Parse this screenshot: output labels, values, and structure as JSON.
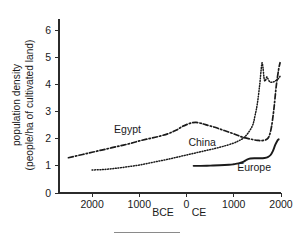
{
  "figure": {
    "name": "population-density-cultivated-land-chart",
    "background": "#ffffff",
    "ink_color": "#1a1a1a"
  },
  "chart_data": {
    "type": "line",
    "title": "",
    "xlabel": "",
    "ylabel": "population density (people/ha of cultivated land)",
    "ylabel_line1": "population density",
    "ylabel_line2": "(people/ha of cultivated land)",
    "xlim": [
      -2700,
      2000
    ],
    "ylim": [
      0,
      6.3
    ],
    "grid": false,
    "legend": "inline-labels",
    "x_axis_note_bce": "BCE",
    "x_axis_note_ce": "CE",
    "y_ticks": [
      0,
      1,
      2,
      3,
      4,
      5,
      6
    ],
    "y_tick_labels": [
      "0",
      "1",
      "2",
      "3",
      "4",
      "5",
      "6"
    ],
    "x_ticks": [
      -2000,
      -1000,
      0,
      1000,
      2000
    ],
    "x_tick_labels": [
      "2000",
      "1000",
      "0",
      "1000",
      "2000"
    ],
    "series": [
      {
        "name": "Egypt",
        "label": "Egypt",
        "style": "dash-dot",
        "color": "#1a1a1a",
        "points": [
          [
            -2500,
            1.3
          ],
          [
            -2200,
            1.42
          ],
          [
            -2000,
            1.5
          ],
          [
            -1800,
            1.58
          ],
          [
            -1600,
            1.66
          ],
          [
            -1400,
            1.74
          ],
          [
            -1200,
            1.82
          ],
          [
            -1000,
            1.92
          ],
          [
            -800,
            2.0
          ],
          [
            -600,
            2.08
          ],
          [
            -400,
            2.18
          ],
          [
            -300,
            2.25
          ],
          [
            -200,
            2.33
          ],
          [
            -100,
            2.44
          ],
          [
            0,
            2.52
          ],
          [
            100,
            2.58
          ],
          [
            200,
            2.6
          ],
          [
            300,
            2.57
          ],
          [
            400,
            2.52
          ],
          [
            600,
            2.42
          ],
          [
            800,
            2.3
          ],
          [
            1000,
            2.18
          ],
          [
            1200,
            2.05
          ],
          [
            1400,
            1.97
          ],
          [
            1500,
            1.94
          ],
          [
            1600,
            1.93
          ],
          [
            1700,
            1.98
          ],
          [
            1750,
            2.1
          ],
          [
            1800,
            2.45
          ],
          [
            1850,
            3.1
          ],
          [
            1900,
            3.95
          ],
          [
            1950,
            4.55
          ],
          [
            1980,
            4.8
          ]
        ]
      },
      {
        "name": "China",
        "label": "China",
        "style": "dotted",
        "color": "#1a1a1a",
        "points": [
          [
            -2000,
            0.85
          ],
          [
            -1800,
            0.86
          ],
          [
            -1600,
            0.89
          ],
          [
            -1400,
            0.93
          ],
          [
            -1200,
            0.98
          ],
          [
            -1000,
            1.03
          ],
          [
            -800,
            1.1
          ],
          [
            -600,
            1.17
          ],
          [
            -400,
            1.24
          ],
          [
            -200,
            1.32
          ],
          [
            0,
            1.4
          ],
          [
            200,
            1.48
          ],
          [
            400,
            1.56
          ],
          [
            600,
            1.64
          ],
          [
            800,
            1.73
          ],
          [
            1000,
            1.84
          ],
          [
            1100,
            1.92
          ],
          [
            1200,
            2.02
          ],
          [
            1300,
            2.2
          ],
          [
            1400,
            2.5
          ],
          [
            1450,
            2.85
          ],
          [
            1500,
            3.3
          ],
          [
            1550,
            4.0
          ],
          [
            1580,
            4.55
          ],
          [
            1600,
            4.8
          ],
          [
            1620,
            4.6
          ],
          [
            1640,
            4.25
          ],
          [
            1660,
            4.12
          ],
          [
            1680,
            4.18
          ],
          [
            1700,
            4.28
          ],
          [
            1720,
            4.22
          ],
          [
            1760,
            4.1
          ],
          [
            1800,
            4.08
          ],
          [
            1850,
            4.1
          ],
          [
            1900,
            4.15
          ],
          [
            1950,
            4.22
          ],
          [
            1980,
            4.3
          ]
        ]
      },
      {
        "name": "Europe",
        "label": "Europe",
        "style": "solid",
        "color": "#1a1a1a",
        "points": [
          [
            150,
            1.0
          ],
          [
            300,
            1.0
          ],
          [
            500,
            1.01
          ],
          [
            700,
            1.02
          ],
          [
            900,
            1.04
          ],
          [
            1000,
            1.06
          ],
          [
            1100,
            1.09
          ],
          [
            1200,
            1.15
          ],
          [
            1280,
            1.23
          ],
          [
            1350,
            1.27
          ],
          [
            1450,
            1.28
          ],
          [
            1550,
            1.28
          ],
          [
            1650,
            1.29
          ],
          [
            1720,
            1.32
          ],
          [
            1780,
            1.4
          ],
          [
            1830,
            1.55
          ],
          [
            1880,
            1.78
          ],
          [
            1920,
            1.92
          ],
          [
            1950,
            1.98
          ]
        ]
      }
    ],
    "annotations": [
      {
        "text": "Egypt",
        "x": -1250,
        "y": 2.22
      },
      {
        "text": "China",
        "x": 330,
        "y": 1.73
      },
      {
        "text": "Europe",
        "x": 1430,
        "y": 0.8
      }
    ]
  }
}
